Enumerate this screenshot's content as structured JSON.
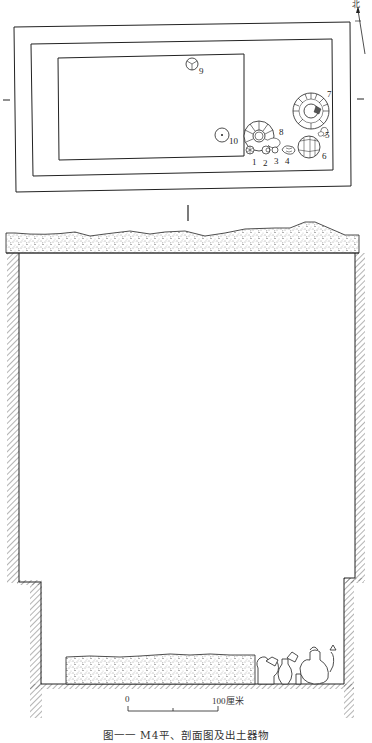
{
  "figure": {
    "caption": "图一一  M4平、剖面图及出土器物",
    "north_label": "北",
    "scale": {
      "start_label": "0",
      "end_label": "100厘米"
    },
    "plan": {
      "artifact_labels": [
        "1",
        "2",
        "3",
        "4",
        "5",
        "6",
        "7",
        "8",
        "9",
        "10"
      ]
    }
  }
}
